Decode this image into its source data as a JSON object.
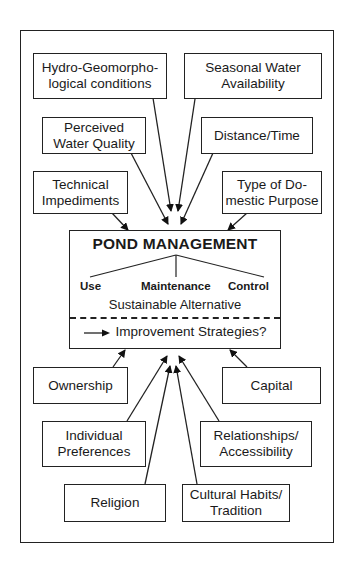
{
  "center": {
    "title": "POND MANAGEMENT",
    "branches": [
      "Use",
      "Maintenance",
      "Control"
    ],
    "sustainable": "Sustainable Alternative",
    "improvement": "Improvement Strategies?"
  },
  "factors_top": [
    {
      "id": "hydro",
      "lines": [
        "Hydro-Geomorpho-",
        "logical conditions"
      ]
    },
    {
      "id": "seasonal",
      "lines": [
        "Seasonal Water",
        "Availability"
      ]
    },
    {
      "id": "perceived",
      "lines": [
        "Perceived",
        "Water Quality"
      ]
    },
    {
      "id": "distance",
      "lines": [
        "Distance/Time"
      ]
    },
    {
      "id": "technical",
      "lines": [
        "Technical",
        "Impediments"
      ]
    },
    {
      "id": "domestic",
      "lines": [
        "Type of Do-",
        "mestic Purpose"
      ]
    }
  ],
  "factors_bottom": [
    {
      "id": "ownership",
      "lines": [
        "Ownership"
      ]
    },
    {
      "id": "capital",
      "lines": [
        "Capital"
      ]
    },
    {
      "id": "individual",
      "lines": [
        "Individual",
        "Preferences"
      ]
    },
    {
      "id": "relationships",
      "lines": [
        "Relationships/",
        "Accessibility"
      ]
    },
    {
      "id": "religion",
      "lines": [
        "Religion"
      ]
    },
    {
      "id": "cultural",
      "lines": [
        "Cultural Habits/",
        "Tradition"
      ]
    }
  ]
}
